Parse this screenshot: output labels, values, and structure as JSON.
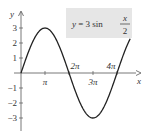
{
  "chart_data": {
    "type": "line",
    "equation": {
      "lhs": "y",
      "coef": "3",
      "fn": "sin",
      "num": "x",
      "den": "2"
    },
    "xlabel": "x",
    "ylabel": "y",
    "x_ticks": [
      {
        "value": 3.14159,
        "label": "π"
      },
      {
        "value": 6.28318,
        "label": "2π"
      },
      {
        "value": 9.42478,
        "label": "3π"
      },
      {
        "value": 12.56637,
        "label": "4π"
      }
    ],
    "y_ticks": [
      {
        "value": 3,
        "label": "3"
      },
      {
        "value": 2,
        "label": "2"
      },
      {
        "value": 1,
        "label": "1"
      },
      {
        "value": -1,
        "label": "−1"
      },
      {
        "value": -2,
        "label": "−2"
      },
      {
        "value": -3,
        "label": "−3"
      }
    ],
    "series": [
      {
        "name": "y = 3 sin(x/2)",
        "x_range": [
          0,
          14.3
        ],
        "amplitude": 3,
        "period": 12.56637
      }
    ],
    "xlim": [
      0,
      14.5
    ],
    "ylim": [
      -3.5,
      3.5
    ],
    "grid": false,
    "colors": {
      "curve": "#222222",
      "axis": "#555555",
      "label_box": "#e6e6e6"
    }
  }
}
